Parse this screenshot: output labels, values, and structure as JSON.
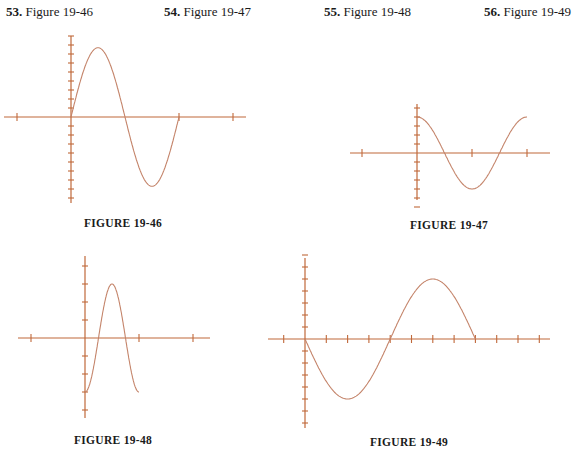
{
  "headers": [
    {
      "num": "53.",
      "label": "Figure 19-46",
      "x": 6
    },
    {
      "num": "54.",
      "label": "Figure 19-47",
      "x": 164
    },
    {
      "num": "55.",
      "label": "Figure 19-48",
      "x": 324
    },
    {
      "num": "56.",
      "label": "Figure 19-49",
      "x": 484
    }
  ],
  "captions": {
    "fig46": "FIGURE 19-46",
    "fig47": "FIGURE 19-47",
    "fig48": "FIGURE 19-48",
    "fig49": "FIGURE 19-49"
  },
  "colors": {
    "axis": "#c0683a",
    "curve": "#c4846a"
  },
  "chart_data": [
    {
      "type": "line",
      "title": "FIGURE 19-46",
      "description": "Sine-like curve starting at origin, one full period; y-axis ticks at unit spacing (8 up, 8 down), x-axis ticks at -1, 2, 3 (relative)",
      "origin_px": [
        71,
        117
      ],
      "x_unit_px": 54,
      "y_unit_px": 9,
      "x_ticks": [
        -1,
        2,
        3
      ],
      "y_ticks": [
        -9,
        -8,
        -7,
        -6,
        -5,
        -4,
        -3,
        -2,
        -1,
        1,
        2,
        3,
        4,
        5,
        6,
        7,
        8,
        9
      ],
      "series": [
        {
          "name": "curve",
          "function": "A*sin(2*pi*x/T)",
          "amplitude": 7.7,
          "period": 2,
          "x_range": [
            0,
            2
          ]
        }
      ]
    },
    {
      "type": "line",
      "title": "FIGURE 19-47",
      "description": "Cosine curve starting at max on y-axis, one full period",
      "origin_px": [
        417,
        153
      ],
      "x_unit_px": 55,
      "y_unit_px": 9,
      "x_ticks": [
        -1,
        1,
        2
      ],
      "y_ticks": [
        -6,
        -5,
        -4,
        -3,
        -2,
        -1,
        1,
        2,
        3,
        4,
        5
      ],
      "series": [
        {
          "name": "curve",
          "function": "A*cos(2*pi*x/T)",
          "amplitude": 4,
          "period": 2,
          "x_range": [
            0,
            2
          ]
        }
      ]
    },
    {
      "type": "line",
      "title": "FIGURE 19-48",
      "description": "Negative cosine curve starting at min on y-axis, one full period",
      "origin_px": [
        85,
        338
      ],
      "x_unit_px": 54,
      "y_unit_px": 18,
      "x_ticks": [
        -1,
        1,
        2
      ],
      "y_ticks": [
        -4,
        -3,
        -2,
        -1,
        1,
        2,
        3,
        4
      ],
      "series": [
        {
          "name": "curve",
          "function": "-A*cos(2*pi*x/T)",
          "amplitude": 3,
          "period": 1,
          "x_range": [
            0,
            1
          ]
        }
      ]
    },
    {
      "type": "line",
      "title": "FIGURE 19-49",
      "description": "Negative sine curve starting at origin, one full period",
      "origin_px": [
        305,
        339
      ],
      "x_unit_px": 21.3,
      "y_unit_px": 12,
      "x_ticks": [
        -1,
        1,
        2,
        3,
        4,
        5,
        6,
        7,
        8,
        9,
        10,
        11
      ],
      "y_ticks": [
        -7,
        -6,
        -5,
        -4,
        -3,
        -2,
        -1,
        1,
        2,
        3,
        4,
        5,
        6,
        7
      ],
      "series": [
        {
          "name": "curve",
          "function": "-A*sin(2*pi*x/T)",
          "amplitude": 5,
          "period": 8,
          "x_range": [
            0,
            8
          ]
        }
      ]
    }
  ]
}
